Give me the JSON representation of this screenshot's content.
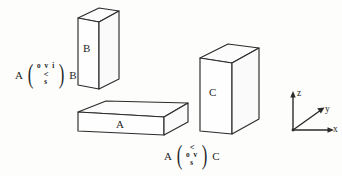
{
  "figure": {
    "background_color": "#fdfdfc",
    "ink_color": "#2b2b2b",
    "blocks": [
      {
        "id": "block-b",
        "label": "B",
        "description": "tall thin upright rectangular block, upper left"
      },
      {
        "id": "block-a",
        "label": "A",
        "description": "wide flat slab, lower middle"
      },
      {
        "id": "block-c",
        "label": "C",
        "description": "upright rectangular slab, right"
      }
    ],
    "relations": [
      {
        "id": "relation-a-b",
        "left_operand": "A",
        "right_operand": "B",
        "stack": [
          "o v i",
          "<",
          "s"
        ]
      },
      {
        "id": "relation-a-c",
        "left_operand": "A",
        "right_operand": "C",
        "stack": [
          "<",
          "o v",
          "s"
        ]
      }
    ],
    "axes": {
      "name": "coordinate-axes",
      "x_label": "x",
      "y_label": "y",
      "z_label": "z"
    }
  }
}
